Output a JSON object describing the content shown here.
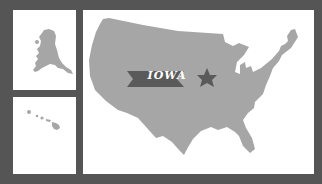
{
  "colors": {
    "background": "#555555",
    "panel": "#ffffff",
    "land": "#a6a6a6",
    "banner": "#5a5a5a",
    "star": "#5a5a5a",
    "banner_text": "#ffffff"
  },
  "panels": {
    "alaska": {
      "name": "Alaska"
    },
    "hawaii": {
      "name": "Hawaii"
    },
    "usa": {
      "name": "Contiguous United States"
    }
  },
  "highlight": {
    "state_label": "IOWA",
    "marker_icon": "star-icon"
  }
}
